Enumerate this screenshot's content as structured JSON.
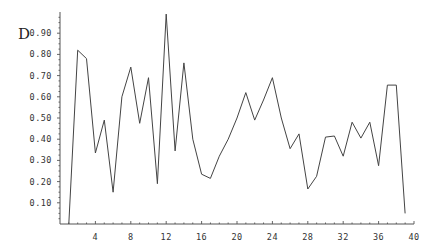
{
  "chart_data": {
    "type": "line",
    "title": "",
    "xlabel": "",
    "ylabel": "D",
    "xlim": [
      0,
      40
    ],
    "ylim": [
      0,
      1.0
    ],
    "grid": false,
    "legend": null,
    "x_ticks": [
      4,
      8,
      12,
      16,
      20,
      24,
      28,
      32,
      36,
      40
    ],
    "y_ticks": [
      0.1,
      0.2,
      0.3,
      0.4,
      0.5,
      0.6,
      0.7,
      0.8,
      0.9
    ],
    "x_tick_labels": [
      "4",
      "8",
      "12",
      "16",
      "20",
      "24",
      "28",
      "32",
      "36",
      "40"
    ],
    "y_tick_labels": [
      "0.10",
      "0.20",
      "0.30",
      "0.40",
      "0.50",
      "0.60",
      "0.70",
      "0.80",
      "0.90"
    ],
    "series": [
      {
        "name": "D",
        "color": "#444444",
        "x": [
          1,
          2,
          3,
          4,
          5,
          6,
          7,
          8,
          9,
          10,
          11,
          12,
          13,
          14,
          15,
          16,
          17,
          18,
          19,
          20,
          21,
          22,
          23,
          24,
          25,
          26,
          27,
          28,
          29,
          30,
          31,
          32,
          33,
          34,
          35,
          36,
          37,
          38,
          39
        ],
        "values": [
          0.0,
          0.82,
          0.78,
          0.335,
          0.49,
          0.15,
          0.6,
          0.74,
          0.475,
          0.69,
          0.19,
          0.99,
          0.345,
          0.76,
          0.4,
          0.235,
          0.215,
          0.32,
          0.4,
          0.5,
          0.62,
          0.49,
          0.585,
          0.69,
          0.5,
          0.355,
          0.425,
          0.165,
          0.225,
          0.41,
          0.415,
          0.32,
          0.48,
          0.405,
          0.48,
          0.275,
          0.655,
          0.655,
          0.05
        ]
      }
    ]
  }
}
